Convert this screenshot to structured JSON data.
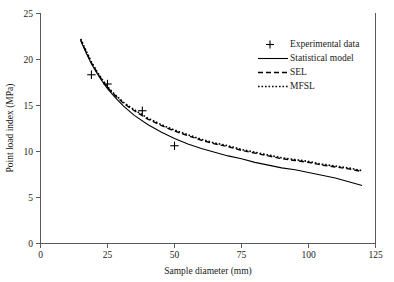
{
  "chart_data": {
    "type": "line",
    "title": "",
    "xlabel": "Sample diameter (mm)",
    "ylabel": "Point load index (MPa)",
    "xlim": [
      0,
      125
    ],
    "ylim": [
      0,
      25
    ],
    "xticks": [
      0,
      25,
      50,
      75,
      100,
      125
    ],
    "yticks": [
      0,
      5,
      10,
      15,
      20,
      25
    ],
    "xtick_labels": [
      "0",
      "25",
      "50",
      "75",
      "100",
      "125"
    ],
    "ytick_labels": [
      "0",
      "5",
      "10",
      "15",
      "20",
      "25"
    ],
    "grid": false,
    "legend_position": "upper right",
    "series": [
      {
        "name": "Experimental data",
        "style": "scatter",
        "marker": "plus",
        "points": [
          {
            "x": 19,
            "y": 18.3
          },
          {
            "x": 25,
            "y": 17.3
          },
          {
            "x": 38,
            "y": 14.4
          },
          {
            "x": 50,
            "y": 10.6
          }
        ]
      },
      {
        "name": "Statistical model",
        "style": "solid",
        "x": [
          15,
          17,
          19,
          21,
          23,
          25,
          28,
          31,
          35,
          40,
          45,
          50,
          55,
          60,
          65,
          70,
          75,
          80,
          85,
          90,
          95,
          100,
          105,
          110,
          115,
          120
        ],
        "y": [
          22.0,
          20.7,
          19.5,
          18.5,
          17.6,
          16.8,
          15.8,
          14.9,
          13.9,
          12.9,
          12.1,
          11.4,
          10.8,
          10.3,
          9.9,
          9.5,
          9.2,
          8.8,
          8.5,
          8.2,
          8.0,
          7.7,
          7.4,
          7.1,
          6.7,
          6.3
        ]
      },
      {
        "name": "SEL",
        "style": "dashed",
        "x": [
          15,
          17,
          19,
          21,
          23,
          25,
          28,
          31,
          35,
          40,
          45,
          50,
          55,
          60,
          65,
          70,
          75,
          80,
          85,
          90,
          95,
          100,
          105,
          110,
          115,
          120
        ],
        "y": [
          22.1,
          20.8,
          19.6,
          18.6,
          17.7,
          16.9,
          16.0,
          15.2,
          14.4,
          13.5,
          12.8,
          12.2,
          11.7,
          11.2,
          10.8,
          10.5,
          10.1,
          9.8,
          9.5,
          9.2,
          9.0,
          8.8,
          8.5,
          8.3,
          8.1,
          7.8
        ]
      },
      {
        "name": "MFSL",
        "style": "dotted",
        "x": [
          15,
          17,
          19,
          21,
          23,
          25,
          28,
          31,
          35,
          40,
          45,
          50,
          55,
          60,
          65,
          70,
          75,
          80,
          85,
          90,
          95,
          100,
          105,
          110,
          115,
          120
        ],
        "y": [
          22.2,
          20.9,
          19.7,
          18.7,
          17.8,
          17.0,
          16.1,
          15.3,
          14.5,
          13.6,
          12.9,
          12.3,
          11.8,
          11.3,
          10.9,
          10.6,
          10.2,
          9.9,
          9.6,
          9.3,
          9.1,
          8.9,
          8.6,
          8.4,
          8.2,
          7.9
        ]
      }
    ]
  },
  "legend": {
    "entries": [
      {
        "label": "Experimental data",
        "glyph": "plus-marker"
      },
      {
        "label": "Statistical model",
        "glyph": "solid-line"
      },
      {
        "label": "SEL",
        "glyph": "dashed-line"
      },
      {
        "label": "MFSL",
        "glyph": "dotted-line"
      }
    ]
  },
  "colors": {
    "axis": "#595959",
    "series": "#000000",
    "background": "#ffffff",
    "text": "#1a1a1a"
  }
}
